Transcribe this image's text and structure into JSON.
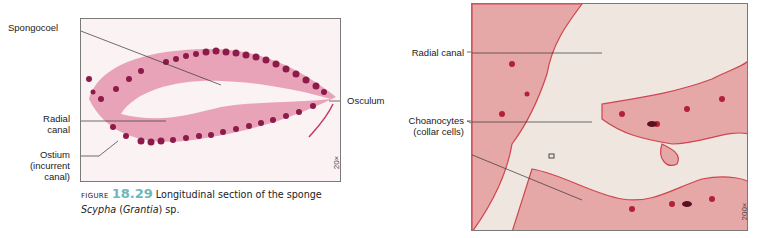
{
  "figure_left": {
    "magnification": "20×",
    "labels": {
      "spongocoel": "Spongocoel",
      "radial_canal_1": "Radial",
      "radial_canal_2": "canal",
      "ostium_1": "Ostium",
      "ostium_2": "(incurrent",
      "ostium_3": "canal)",
      "osculum": "Osculum"
    },
    "caption": {
      "prefix": "Figure",
      "number": "18.29",
      "text": "Longitudinal section of the sponge",
      "genus": "Scypha",
      "open_paren": " (",
      "alt_genus": "Grantia",
      "suffix": ") sp."
    }
  },
  "figure_right": {
    "magnification": "200×",
    "labels": {
      "radial_canal": "Radial canal",
      "choanocytes_1": "Choanocytes",
      "choanocytes_2": "(collar cells)"
    }
  },
  "colors": {
    "stain_dark": "#8c1a4a",
    "stain_mid": "#c23a6a",
    "stain_light": "#e7a6b9",
    "tissue_red": "#d0444f",
    "caption_number": "#6fb7bc"
  }
}
